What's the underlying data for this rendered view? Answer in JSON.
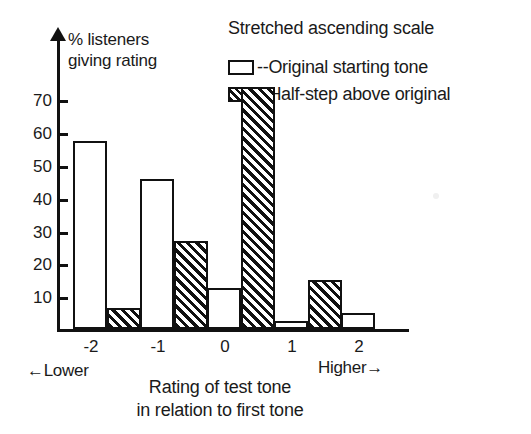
{
  "chart_data": {
    "type": "bar",
    "title": "Stretched ascending scale",
    "xlabel": "Rating of test tone in relation to first tone",
    "ylabel": "% listeners giving rating",
    "categories": [
      "-2",
      "-1",
      "0",
      "1",
      "2"
    ],
    "series": [
      {
        "name": "Original starting tone",
        "pattern": "open",
        "values": [
          48,
          38.5,
          10.5,
          2,
          4
        ]
      },
      {
        "name": "Half-step above original",
        "pattern": "hatched",
        "values": [
          5.5,
          22.5,
          62,
          12.5,
          0
        ]
      }
    ],
    "ylim": [
      0,
      75
    ],
    "yticks": [
      10,
      20,
      30,
      40,
      50,
      60,
      70
    ],
    "ytick_labels": [
      "10",
      "20",
      "30",
      "40",
      "50",
      "60",
      "70"
    ],
    "grid": false,
    "legend_position": "top-right",
    "annotations": {
      "left_axis_note": "←Lower",
      "right_axis_note": "Higher→",
      "y_axis_caption_line1": "% listeners",
      "y_axis_caption_line2": "giving rating",
      "x_axis_caption_line1": "Rating of test tone",
      "x_axis_caption_line2": "in relation to first tone"
    },
    "colors": {
      "ink": "#111111",
      "background": "#ffffff"
    }
  },
  "legend": {
    "title": "Stretched ascending scale",
    "items": [
      {
        "label": "--Original starting tone"
      },
      {
        "label": "--Half-step above original"
      }
    ]
  }
}
